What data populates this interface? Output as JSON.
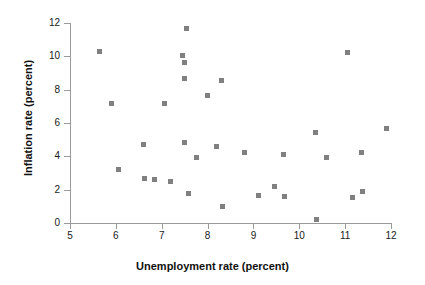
{
  "chart_data": {
    "type": "scatter",
    "title": "",
    "xlabel": "Unemployment rate (percent)",
    "ylabel": "Inflation rate (percent)",
    "xlim": [
      5,
      12
    ],
    "ylim": [
      0,
      12
    ],
    "xticks": [
      5,
      6,
      7,
      8,
      9,
      10,
      11,
      12
    ],
    "yticks": [
      0,
      2,
      4,
      6,
      8,
      10,
      12
    ],
    "xticklabels": [
      "5",
      "6",
      "7",
      "8",
      "9",
      "10",
      "11",
      "12"
    ],
    "yticklabels": [
      "0",
      "2",
      "4",
      "6",
      "8",
      "10",
      "12"
    ],
    "grid": false,
    "legend": null,
    "marker": "square",
    "marker_color": "#808080",
    "marker_size": 5,
    "points": [
      {
        "x": 5.65,
        "y": 10.3
      },
      {
        "x": 5.9,
        "y": 7.2
      },
      {
        "x": 6.05,
        "y": 3.2
      },
      {
        "x": 6.6,
        "y": 4.7
      },
      {
        "x": 6.62,
        "y": 2.7
      },
      {
        "x": 6.85,
        "y": 2.6
      },
      {
        "x": 7.05,
        "y": 7.2
      },
      {
        "x": 7.2,
        "y": 2.5
      },
      {
        "x": 7.45,
        "y": 10.05
      },
      {
        "x": 7.5,
        "y": 9.65
      },
      {
        "x": 7.5,
        "y": 8.7
      },
      {
        "x": 7.5,
        "y": 4.85
      },
      {
        "x": 7.55,
        "y": 11.65
      },
      {
        "x": 7.58,
        "y": 1.75
      },
      {
        "x": 7.75,
        "y": 3.95
      },
      {
        "x": 8.0,
        "y": 7.65
      },
      {
        "x": 8.2,
        "y": 4.6
      },
      {
        "x": 8.3,
        "y": 8.55
      },
      {
        "x": 8.32,
        "y": 1.0
      },
      {
        "x": 8.8,
        "y": 4.25
      },
      {
        "x": 9.1,
        "y": 1.65
      },
      {
        "x": 9.45,
        "y": 2.2
      },
      {
        "x": 9.65,
        "y": 4.1
      },
      {
        "x": 9.68,
        "y": 1.6
      },
      {
        "x": 10.35,
        "y": 5.45
      },
      {
        "x": 10.37,
        "y": 0.2
      },
      {
        "x": 10.6,
        "y": 3.95
      },
      {
        "x": 11.05,
        "y": 10.25
      },
      {
        "x": 11.15,
        "y": 1.55
      },
      {
        "x": 11.35,
        "y": 4.25
      },
      {
        "x": 11.38,
        "y": 1.9
      },
      {
        "x": 11.9,
        "y": 5.7
      }
    ]
  },
  "axes": {
    "axis_color": "#9a9a9a",
    "tick_length": 6
  }
}
